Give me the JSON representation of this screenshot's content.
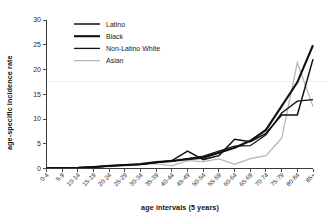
{
  "figure": {
    "background_color": "#ffffff",
    "width": 328,
    "height": 224
  },
  "chart_data": {
    "type": "line",
    "title": "",
    "subtitle": "",
    "xlabel": "age intervals (5 years)",
    "ylabel": "age-specific incidence rate",
    "categories": [
      "0-4",
      "5-9",
      "10-14",
      "15-19",
      "20-24",
      "25-29",
      "30-34",
      "35-39",
      "40-44",
      "45-49",
      "50-54",
      "55-59",
      "60-64",
      "65-69",
      "70-74",
      "75-79",
      "80-84",
      "85+"
    ],
    "xlim": [
      0,
      17
    ],
    "ylim": [
      0,
      30
    ],
    "yticks": [
      0,
      5,
      10,
      15,
      20,
      25,
      30
    ],
    "ytick_labels": [
      "0",
      "5",
      "10",
      "15",
      "20",
      "25",
      "30"
    ],
    "grid": false,
    "faint_gridline_y": 17.5,
    "legend_position": "upper-left-inside",
    "series": [
      {
        "name": "Latino",
        "color": "#111111",
        "stroke_width": 1.5,
        "values": [
          0.1,
          0.1,
          0.15,
          0.3,
          0.5,
          0.75,
          0.8,
          1.2,
          1.6,
          3.5,
          1.8,
          2.6,
          5.9,
          5.4,
          7.1,
          10.8,
          10.8,
          22.1
        ]
      },
      {
        "name": "Black",
        "color": "#111111",
        "stroke_width": 2.1,
        "values": [
          0.1,
          0.1,
          0.15,
          0.3,
          0.55,
          0.7,
          0.9,
          1.3,
          1.5,
          1.9,
          2.2,
          3.2,
          4.2,
          5.6,
          7.8,
          12.6,
          17.4,
          24.9
        ]
      },
      {
        "name": "Non-Latino White",
        "color": "#111111",
        "stroke_width": 1.3,
        "values": [
          0.1,
          0.1,
          0.15,
          0.3,
          0.5,
          0.7,
          0.85,
          1.2,
          1.45,
          2.0,
          2.5,
          3.5,
          4.5,
          4.6,
          6.8,
          11.2,
          13.6,
          13.9
        ]
      },
      {
        "name": "Asian",
        "color": "#b6b6b6",
        "stroke_width": 1.3,
        "values": [
          0.05,
          0.05,
          0.1,
          0.2,
          0.4,
          0.55,
          0.8,
          1.0,
          0.55,
          1.6,
          1.4,
          1.95,
          0.85,
          2.0,
          2.6,
          6.1,
          21.4,
          12.5
        ]
      }
    ]
  }
}
